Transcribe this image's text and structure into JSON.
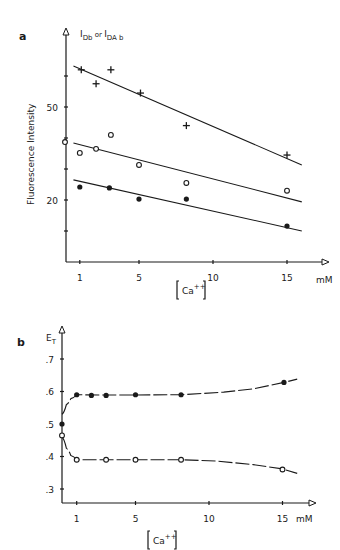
{
  "figure": {
    "panel_a_label": "a",
    "panel_b_label": "b"
  },
  "chart_data": [
    {
      "panel": "a",
      "type": "scatter",
      "title": "",
      "ylabel": "Fluorescence Intensity",
      "ylabel_top": "I_Db or I_DAb",
      "xlabel": "[Ca++]",
      "xunit": "mM",
      "xticks": [
        1,
        5,
        10,
        15
      ],
      "yticks": [
        20,
        50
      ],
      "yminor_ticks": [
        10,
        30,
        40,
        60
      ],
      "xlim": [
        0,
        17.5
      ],
      "ylim": [
        0,
        68
      ],
      "grid": false,
      "series": [
        {
          "name": "plus",
          "marker": "plus",
          "x": [
            1.1,
            2.1,
            3.1,
            5.1,
            8.2,
            15
          ],
          "y": [
            62,
            57.5,
            62,
            54.5,
            44,
            34.5
          ],
          "fit_line": [
            [
              0.3,
              63.2
            ],
            [
              16,
              31.3
            ]
          ]
        },
        {
          "name": "open-circle",
          "marker": "open-circle",
          "x": [
            0,
            1,
            2.1,
            3.1,
            5,
            8.2,
            15
          ],
          "y": [
            38.7,
            35.2,
            36.5,
            41,
            31.3,
            25.5,
            23
          ],
          "fit_line": [
            [
              0.3,
              38.4
            ],
            [
              16,
              19.4
            ]
          ]
        },
        {
          "name": "filled-circle",
          "marker": "filled-circle",
          "x": [
            1,
            3,
            5,
            8.2,
            15
          ],
          "y": [
            24.2,
            23.9,
            20.3,
            20.3,
            11.6
          ],
          "fit_line": [
            [
              0.3,
              26.5
            ],
            [
              16,
              10
            ]
          ]
        }
      ]
    },
    {
      "panel": "b",
      "type": "line",
      "title": "",
      "ylabel": "E_T",
      "xlabel": "[Ca++]",
      "xunit": "mM",
      "xticks": [
        1,
        5,
        10,
        15
      ],
      "yticks": [
        0.3,
        0.4,
        0.5,
        0.6,
        0.7
      ],
      "ytick_labels": [
        ".3",
        ".4",
        ".5",
        ".6",
        ".7"
      ],
      "xlim": [
        0,
        17.5
      ],
      "ylim": [
        0.245,
        0.8
      ],
      "grid": false,
      "series": [
        {
          "name": "filled-circle",
          "marker": "filled-circle",
          "x": [
            0,
            1,
            2,
            3,
            5,
            8.1,
            15.1
          ],
          "y": [
            0.5,
            0.59,
            0.588,
            0.588,
            0.59,
            0.59,
            0.628
          ],
          "curve": [
            [
              0,
              0.53
            ],
            [
              0.3,
              0.56
            ],
            [
              0.6,
              0.578
            ],
            [
              1,
              0.59
            ],
            [
              3,
              0.589
            ],
            [
              8.1,
              0.59
            ],
            [
              11,
              0.598
            ],
            [
              13,
              0.608
            ],
            [
              15.1,
              0.628
            ],
            [
              16,
              0.638
            ]
          ]
        },
        {
          "name": "open-circle",
          "marker": "open-circle",
          "x": [
            0,
            1,
            3,
            5,
            8.1,
            15
          ],
          "y": [
            0.465,
            0.39,
            0.39,
            0.39,
            0.39,
            0.36
          ],
          "curve": [
            [
              0,
              0.46
            ],
            [
              0.3,
              0.425
            ],
            [
              0.6,
              0.403
            ],
            [
              1,
              0.39
            ],
            [
              3,
              0.39
            ],
            [
              8.1,
              0.39
            ],
            [
              10.5,
              0.386
            ],
            [
              13,
              0.375
            ],
            [
              15,
              0.362
            ],
            [
              16,
              0.348
            ]
          ]
        }
      ]
    }
  ]
}
